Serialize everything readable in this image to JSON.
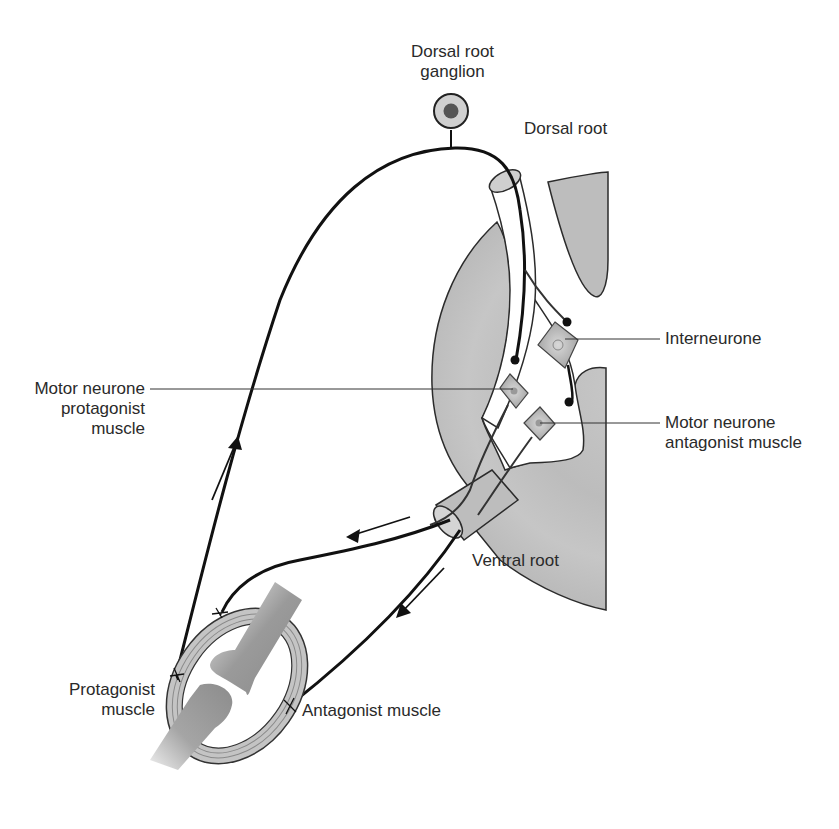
{
  "figure": {
    "colors": {
      "background": "#ffffff",
      "grey_matter": "#bdbdbd",
      "grey_matter_light": "#cfcfcf",
      "outline": "#2b2b2b",
      "nerve": "#111111",
      "neurone_fill": "#b5b5b5",
      "label_text": "#2a2a2a",
      "ganglion_outer": "#d0d0d0",
      "ganglion_inner": "#555555"
    },
    "labels": {
      "dorsal_root_ganglion_line1": "Dorsal root",
      "dorsal_root_ganglion_line2": "ganglion",
      "dorsal_root": "Dorsal root",
      "interneurone": "Interneurone",
      "motor_neurone_protagonist_line1": "Motor neurone",
      "motor_neurone_protagonist_line2": "protagonist",
      "motor_neurone_protagonist_line3": "muscle",
      "motor_neurone_antagonist_line1": "Motor neurone",
      "motor_neurone_antagonist_line2": "antagonist muscle",
      "ventral_root": "Ventral root",
      "protagonist_muscle_line1": "Protagonist",
      "protagonist_muscle_line2": "muscle",
      "antagonist_muscle": "Antagonist muscle"
    },
    "arrows": [
      {
        "name": "afferent-arrow",
        "direction": "up"
      },
      {
        "name": "efferent-protagonist-arrow",
        "direction": "left"
      },
      {
        "name": "efferent-antagonist-arrow",
        "direction": "down-left"
      }
    ]
  }
}
